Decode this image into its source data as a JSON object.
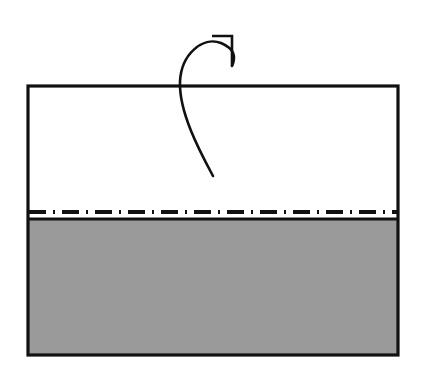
{
  "figure": {
    "title": "Paper folding step diagram",
    "canvas": {
      "width": 423,
      "height": 385,
      "background": "#ffffff"
    },
    "colors": {
      "outline": "#111111",
      "shaded_fill": "#9a9a9a",
      "unshaded_fill": "#ffffff",
      "fold_line": "#111111",
      "arrow": "#111111"
    },
    "sheet": {
      "name": "paper-sheet",
      "x": 28,
      "y": 86,
      "width": 370,
      "height": 269,
      "stroke_width": 3.2
    },
    "panels": [
      {
        "name": "upper-panel",
        "label": "white side",
        "fill": "#ffffff",
        "x": 28,
        "y": 86,
        "width": 370,
        "height": 133
      },
      {
        "name": "lower-panel",
        "label": "shaded side",
        "fill": "#9a9a9a",
        "x": 28,
        "y": 219,
        "width": 370,
        "height": 136
      }
    ],
    "fold_line": {
      "name": "valley-fold-line",
      "style": "dash-dot",
      "x1": 28,
      "x2": 398,
      "y": 212,
      "stroke_width": 4,
      "dash_pattern": "17 7 2 7"
    },
    "divider_line": {
      "name": "panel-divider",
      "style": "solid",
      "x1": 28,
      "x2": 398,
      "y": 219,
      "stroke_width": 3.2
    },
    "arrow": {
      "name": "fold-arrow",
      "style": "curved-hook",
      "stroke_width": 2.6,
      "path": "M 213,176 C 197,146 178,106 181,78 C 184,50 207,36 222,43 C 236,50 236,58 232,66",
      "head": {
        "type": "open-barb",
        "points": "212,36 232,36 232,66",
        "stroke_width": 2.6
      }
    }
  }
}
